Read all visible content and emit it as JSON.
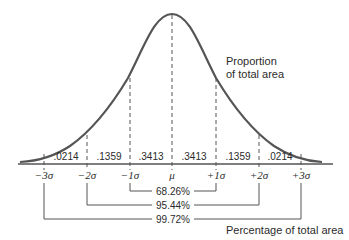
{
  "diagram": {
    "curve_label": [
      "Proportion",
      "of total area"
    ],
    "bottom_label": "Percentage of total area",
    "axis_ticks": [
      "−3σ",
      "−2σ",
      "−1σ",
      "μ",
      "+1σ",
      "+2σ",
      "+3σ"
    ],
    "region_proportions": [
      ".0214",
      ".1359",
      ".3413",
      ".3413",
      ".1359",
      ".0214"
    ],
    "brackets": [
      {
        "range": "±1σ",
        "label": "68.26%"
      },
      {
        "range": "±2σ",
        "label": "95.44%"
      },
      {
        "range": "±3σ",
        "label": "99.72%"
      }
    ],
    "colors": {
      "curve": "#555555",
      "axis": "#555555",
      "text": "#2b2b2b"
    }
  }
}
